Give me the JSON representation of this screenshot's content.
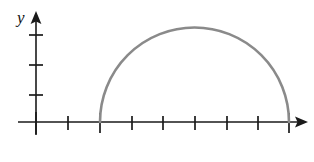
{
  "figure": {
    "background_color": "#ffffff",
    "width": 314,
    "height": 162
  },
  "axes": {
    "axis_color": "#1a1a1a",
    "axis_stroke_width": 1.6,
    "y_axis": {
      "label": "y",
      "label_x": 17,
      "label_y": 23,
      "x": 36,
      "top_y": 12,
      "bottom_y": 135,
      "arrow": "up-arrow",
      "tick_half_length": 7,
      "ticks": [
        35,
        65,
        95
      ]
    },
    "x_axis": {
      "label": "",
      "y": 122,
      "left_x": 18,
      "right_x": 308,
      "arrow": "right-arrow",
      "tick_half_length_minor": 6,
      "tick_half_length_major": 10,
      "origin_x": 36,
      "tick_spacing": 31.6,
      "ticks": [
        {
          "x": 68,
          "major": false
        },
        {
          "x": 100,
          "major": true
        },
        {
          "x": 132,
          "major": false
        },
        {
          "x": 163,
          "major": false
        },
        {
          "x": 195,
          "major": false
        },
        {
          "x": 227,
          "major": false
        },
        {
          "x": 258,
          "major": false
        },
        {
          "x": 289,
          "major": true
        }
      ]
    }
  },
  "chart_data": {
    "type": "line",
    "title": "",
    "subtitle": "",
    "xlabel": "",
    "ylabel": "y",
    "grid": false,
    "legend": null,
    "annotations": [],
    "curve": {
      "name": "semicircle",
      "shape": "upper-semicircle",
      "color": "#8a8a8a",
      "stroke_width": 2.6,
      "center_x": 194.5,
      "center_y": 122,
      "radius": 94.5,
      "left_endpoint_x": 100,
      "left_endpoint_y": 122,
      "right_endpoint_x": 289,
      "right_endpoint_y": 122,
      "apex_x": 194.5,
      "apex_y": 33,
      "path": "M 100 122 A 94.5 94.5 0 0 1 289 122"
    },
    "x_units": {
      "left_endpoint_units": 2,
      "right_endpoint_units": 8,
      "radius_units": 3,
      "apex_units": 5
    },
    "x": [
      2,
      2.5,
      3,
      3.5,
      4,
      4.5,
      5,
      5.5,
      6,
      6.5,
      7,
      7.5,
      8
    ],
    "y": [
      0,
      1.66,
      2.24,
      2.6,
      2.83,
      2.96,
      3.0,
      2.96,
      2.83,
      2.6,
      2.24,
      1.66,
      0
    ],
    "xlim": [
      0,
      8.6
    ],
    "ylim": [
      0,
      3.5
    ]
  }
}
